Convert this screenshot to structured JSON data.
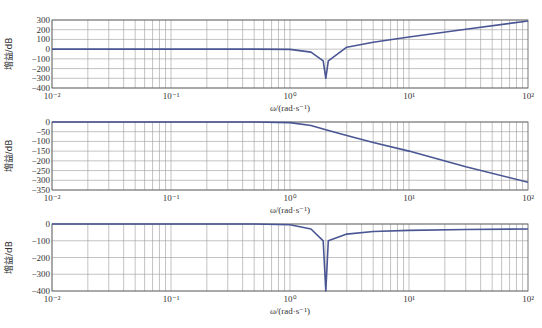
{
  "figure": {
    "line_color": "#4a5694",
    "grid_color": "#9a9a9a",
    "frame_color": "#555555"
  },
  "chart_data": [
    {
      "type": "line",
      "title": "",
      "xlabel": "ω/(rad·s⁻¹)",
      "ylabel": "增益/dB",
      "xscale": "log",
      "xlim": [
        0.01,
        100
      ],
      "ylim": [
        -400,
        300
      ],
      "x_ticks": [
        "10⁻²",
        "10⁻¹",
        "10⁰",
        "10¹",
        "10²"
      ],
      "y_ticks": [
        "300",
        "200",
        "100",
        "0",
        "-100",
        "-200",
        "-300",
        "-400"
      ],
      "grid": true,
      "series": [
        {
          "name": "gain",
          "x": [
            0.01,
            0.1,
            0.5,
            1,
            1.5,
            1.9,
            2.0,
            2.1,
            3,
            5,
            10,
            30,
            100
          ],
          "y": [
            0,
            0,
            0,
            -3,
            -30,
            -120,
            -300,
            -120,
            20,
            70,
            125,
            205,
            290
          ]
        }
      ]
    },
    {
      "type": "line",
      "title": "",
      "xlabel": "ω/(rad·s⁻¹)",
      "ylabel": "增益/dB",
      "xscale": "log",
      "xlim": [
        0.01,
        100
      ],
      "ylim": [
        -350,
        0
      ],
      "x_ticks": [
        "10⁻²",
        "10⁻¹",
        "10⁰",
        "10¹",
        "10²"
      ],
      "y_ticks": [
        "0",
        "-50",
        "-100",
        "-150",
        "-200",
        "-250",
        "-300",
        "-350"
      ],
      "grid": true,
      "series": [
        {
          "name": "gain",
          "x": [
            0.01,
            0.1,
            0.5,
            1,
            1.5,
            2,
            3,
            5,
            10,
            30,
            100
          ],
          "y": [
            0,
            0,
            0,
            -3,
            -18,
            -40,
            -70,
            -105,
            -150,
            -230,
            -310
          ]
        }
      ]
    },
    {
      "type": "line",
      "title": "",
      "xlabel": "ω/(rad·s⁻¹)",
      "ylabel": "增益/dB",
      "xscale": "log",
      "xlim": [
        0.01,
        100
      ],
      "ylim": [
        -400,
        0
      ],
      "x_ticks": [
        "10⁻²",
        "10⁻¹",
        "10⁰",
        "10¹",
        "10²"
      ],
      "y_ticks": [
        "0",
        "-100",
        "-200",
        "-300",
        "-400"
      ],
      "grid": true,
      "series": [
        {
          "name": "gain",
          "x": [
            0.01,
            0.1,
            0.5,
            1,
            1.5,
            1.9,
            2.0,
            2.1,
            3,
            5,
            10,
            30,
            100
          ],
          "y": [
            0,
            0,
            0,
            -5,
            -30,
            -100,
            -400,
            -100,
            -60,
            -45,
            -38,
            -33,
            -30
          ]
        }
      ]
    }
  ]
}
